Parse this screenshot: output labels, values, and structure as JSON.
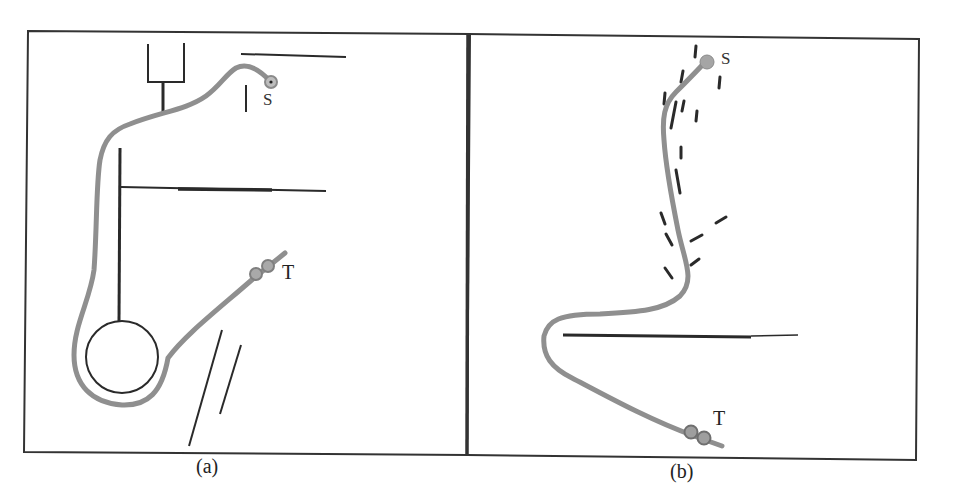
{
  "figure": {
    "panels": [
      {
        "id": "a",
        "caption": "(a)",
        "start_label": "S",
        "target_label": "T",
        "description": "Robot path from S around obstacles and a circular obstacle to T"
      },
      {
        "id": "b",
        "caption": "(b)",
        "start_label": "S",
        "target_label": "T",
        "description": "Robot path from S through scattered small obstacles, around a horizontal wall, to T"
      }
    ],
    "colors": {
      "frame": "#333333",
      "obstacle": "#2a2a2a",
      "path": "#8f8f8f",
      "marker": "#9a9a9a"
    }
  }
}
